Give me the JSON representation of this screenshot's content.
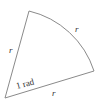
{
  "diagram": {
    "title": "",
    "labels": {
      "left_side": "r",
      "arc": "r",
      "bottom_side": "r",
      "angle": "1 rad"
    },
    "colors": {
      "stroke": "#8a8a8a",
      "text": "#333333",
      "background": "#ffffff"
    }
  }
}
